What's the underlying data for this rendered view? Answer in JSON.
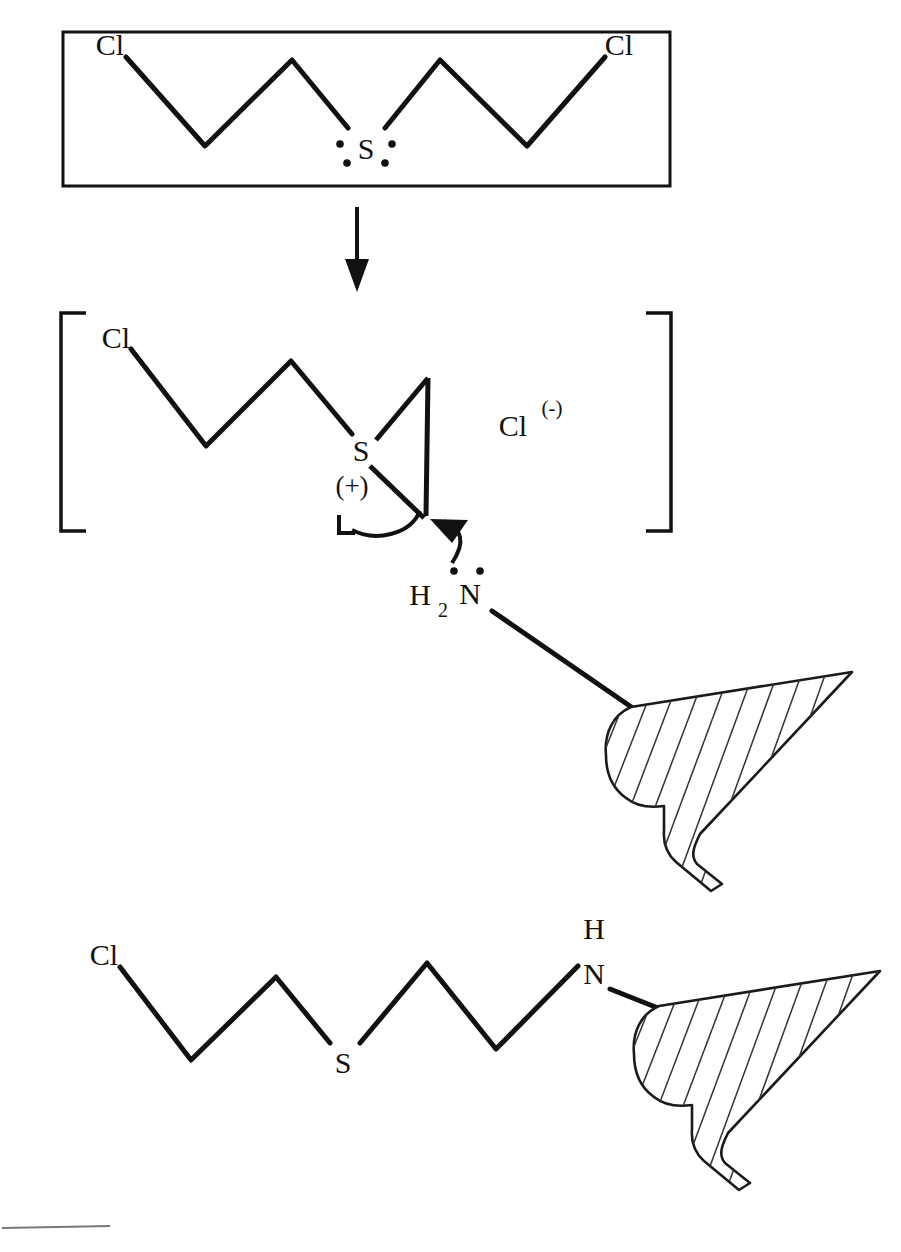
{
  "figure": {
    "kind": "chemical-reaction-scheme"
  },
  "reactant_box": {
    "left_chlorine_label": "Cl",
    "right_chlorine_label": "Cl",
    "sulfur_label": "S",
    "lone_pair_count": 4
  },
  "reaction_arrow": {
    "direction": "down",
    "label": ""
  },
  "intermediate": {
    "bracket_left": "[",
    "bracket_right": "]",
    "chlorine_label": "Cl",
    "sulfur_label": "S",
    "sulfur_charge_label": "(+)",
    "counter_ion_label": "Cl",
    "counter_ion_charge_label": "(-)",
    "nucleophile_h_label": "H",
    "nucleophile_h_subscript": "2",
    "nucleophile_n_label": "N",
    "nucleophile_lone_pair_count": 2,
    "curly_arrow_ring_opening": "ring-opening-electron-flow",
    "curly_arrow_nucleophile_attack": "nucleophile-attack-electron-flow"
  },
  "product": {
    "chlorine_label": "Cl",
    "sulfur_label": "S",
    "nitrogen_label": "N",
    "nitrogen_h_label": "H"
  },
  "macromolecule": {
    "name": "hatched-macromolecule",
    "hatch_line_count": 13
  },
  "colors": {
    "ink": "#111111",
    "background": "#ffffff",
    "hatch": "#333333",
    "rule": "#777777"
  }
}
